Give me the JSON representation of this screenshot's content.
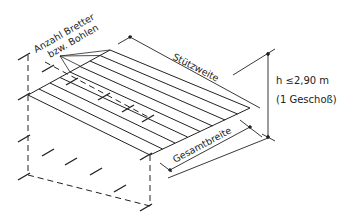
{
  "labels": {
    "count_line1": "Anzahl Bretter",
    "count_line2": "bzw. Bohlen",
    "span": "Stützweite",
    "total_width": "Gesamtbreite",
    "height": "h ≤2,90  m",
    "storey": "(1  Geschoß)"
  },
  "colors": {
    "line": "#222222",
    "background": "#ffffff"
  }
}
